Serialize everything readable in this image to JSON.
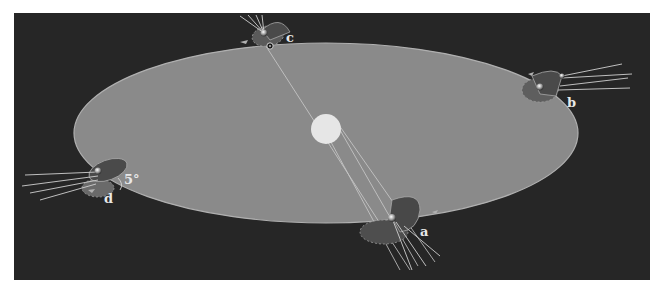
{
  "diagram": {
    "type": "orbital-geometry",
    "background_color": "#262626",
    "orbit_plane_color": "#8a8a8a",
    "sun_color": "#e6e6e6",
    "center_body": {
      "name": "sun",
      "label": ""
    },
    "positions": [
      {
        "id": "a",
        "label": "a"
      },
      {
        "id": "b",
        "label": "b"
      },
      {
        "id": "c",
        "label": "c"
      },
      {
        "id": "d",
        "label": "d"
      }
    ],
    "annotations": {
      "inclination_angle": "5°",
      "node_symbol": "⊙"
    }
  }
}
